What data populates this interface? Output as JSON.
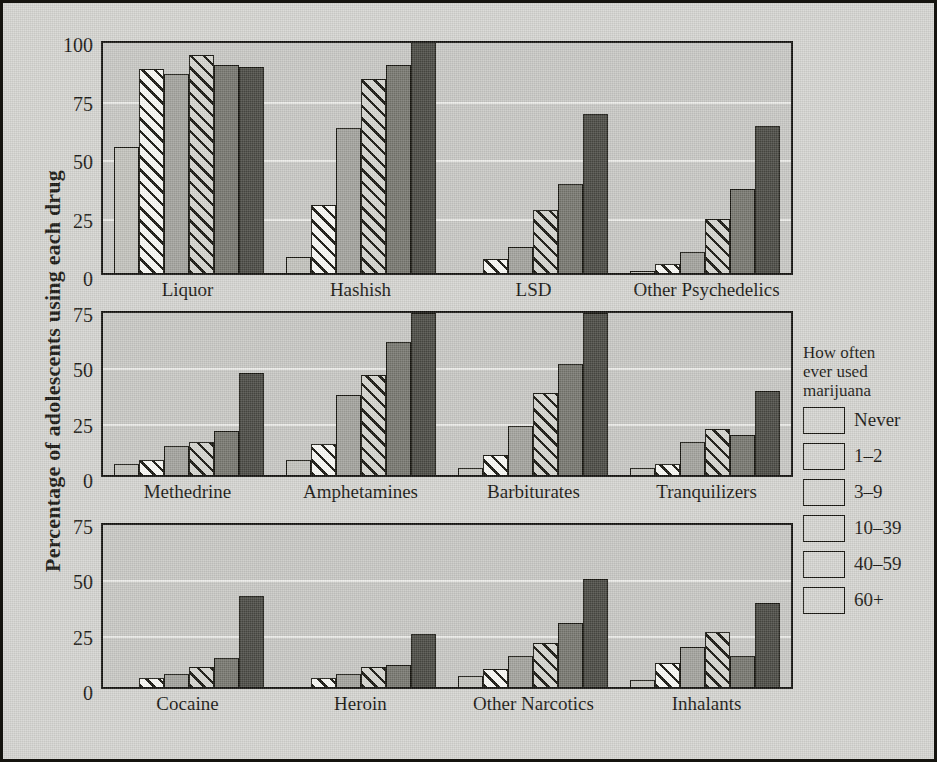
{
  "figure": {
    "ylabel": "Percentage of adolescents using each drug"
  },
  "legend": {
    "title": "How often\never used\nmarijuana",
    "title_lines": [
      "How often",
      "ever used",
      "marijuana"
    ],
    "entries": [
      {
        "label": "Never",
        "fill": "solid-light",
        "color": "#c3c3bd"
      },
      {
        "label": "1–2",
        "fill": "hatch-white",
        "color": "#fbfbf7"
      },
      {
        "label": "3–9",
        "fill": "solid-medium",
        "color": "#a3a39d"
      },
      {
        "label": "10–39",
        "fill": "hatch-gray",
        "color": "#c7c7c1"
      },
      {
        "label": "40–59",
        "fill": "solid-dark",
        "color": "#77776f"
      },
      {
        "label": "60+",
        "fill": "solid-darkest",
        "color": "#4a4a44"
      }
    ]
  },
  "chart_data": {
    "type": "bar",
    "title": "",
    "xlabel": "",
    "ylabel": "Percentage of adolescents using each drug",
    "grid": true,
    "legend_position": "right",
    "series_names": [
      "Never",
      "1–2",
      "3–9",
      "10–39",
      "40–59",
      "60+"
    ],
    "panels": [
      {
        "name": "panel-top",
        "ylim": [
          0,
          100
        ],
        "yticks": [
          0,
          25,
          50,
          75,
          100
        ],
        "categories": [
          "Liquor",
          "Hashish",
          "LSD",
          "Other Psychedelics"
        ],
        "series": [
          {
            "name": "Never",
            "values": [
              54,
              7,
              0,
              1
            ]
          },
          {
            "name": "1–2",
            "values": [
              87,
              29,
              6,
              4
            ]
          },
          {
            "name": "3–9",
            "values": [
              85,
              62,
              11,
              9
            ]
          },
          {
            "name": "10–39",
            "values": [
              93,
              83,
              27,
              23
            ]
          },
          {
            "name": "40–59",
            "values": [
              89,
              89,
              38,
              36
            ]
          },
          {
            "name": "60+",
            "values": [
              88,
              100,
              68,
              63
            ]
          }
        ]
      },
      {
        "name": "panel-middle",
        "ylim": [
          0,
          75
        ],
        "yticks": [
          0,
          25,
          50,
          75
        ],
        "categories": [
          "Methedrine",
          "Amphetamines",
          "Barbiturates",
          "Tranquilizers"
        ],
        "series": [
          {
            "name": "Never",
            "values": [
              5,
              7,
              3,
              3
            ]
          },
          {
            "name": "1–2",
            "values": [
              7,
              14,
              9,
              5
            ]
          },
          {
            "name": "3–9",
            "values": [
              13,
              36,
              22,
              15
            ]
          },
          {
            "name": "10–39",
            "values": [
              15,
              45,
              37,
              21
            ]
          },
          {
            "name": "40–59",
            "values": [
              20,
              60,
              50,
              18
            ]
          },
          {
            "name": "60+",
            "values": [
              46,
              73,
              73,
              38
            ]
          }
        ]
      },
      {
        "name": "panel-bottom",
        "ylim": [
          0,
          75
        ],
        "yticks": [
          0,
          25,
          50,
          75
        ],
        "categories": [
          "Cocaine",
          "Heroin",
          "Other Narcotics",
          "Inhalants"
        ],
        "series": [
          {
            "name": "Never",
            "values": [
              0,
              0,
              5,
              3
            ]
          },
          {
            "name": "1–2",
            "values": [
              4,
              4,
              8,
              11
            ]
          },
          {
            "name": "3–9",
            "values": [
              6,
              6,
              14,
              18
            ]
          },
          {
            "name": "10–39",
            "values": [
              9,
              9,
              20,
              25
            ]
          },
          {
            "name": "40–59",
            "values": [
              13,
              10,
              29,
              14
            ]
          },
          {
            "name": "60+",
            "values": [
              41,
              24,
              49,
              38
            ]
          }
        ]
      }
    ]
  }
}
